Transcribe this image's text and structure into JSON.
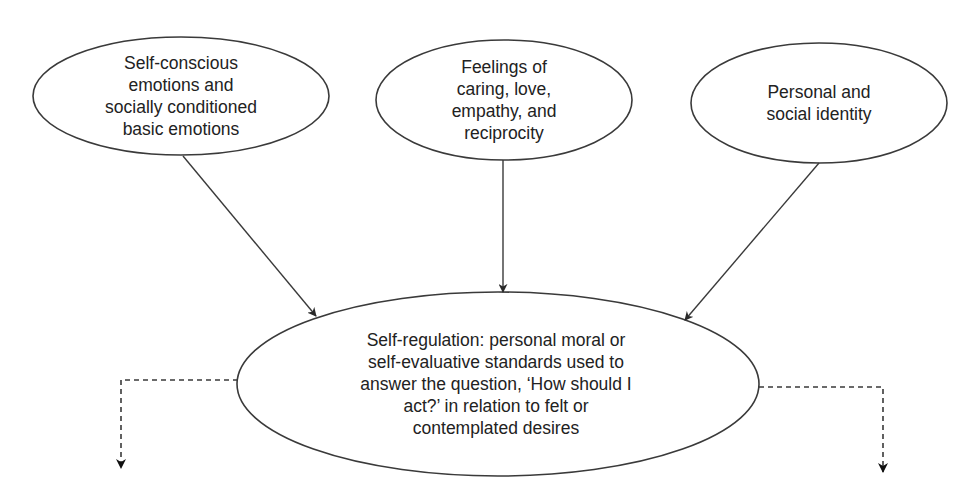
{
  "diagram": {
    "type": "flow",
    "colors": {
      "stroke": "#3a3a3a",
      "text": "#222222",
      "background": "#ffffff"
    },
    "nodes": [
      {
        "id": "self-conscious-emotions",
        "label": "Self-conscious\nemotions and\nsocially conditioned\nbasic emotions",
        "shape": "ellipse"
      },
      {
        "id": "feelings-of-caring",
        "label": "Feelings of\ncaring, love,\nempathy, and\nreciprocity",
        "shape": "ellipse"
      },
      {
        "id": "personal-social-identity",
        "label": "Personal and\nsocial identity",
        "shape": "ellipse"
      },
      {
        "id": "self-regulation",
        "label": "Self-regulation: personal moral or\nself-evaluative standards used to\nanswer the question, ‘How should I\nact?’ in relation to felt or\ncontemplated desires",
        "shape": "ellipse"
      }
    ],
    "edges": [
      {
        "from": "self-conscious-emotions",
        "to": "self-regulation",
        "style": "solid"
      },
      {
        "from": "feelings-of-caring",
        "to": "self-regulation",
        "style": "solid"
      },
      {
        "from": "personal-social-identity",
        "to": "self-regulation",
        "style": "solid"
      },
      {
        "from": "self-regulation",
        "to": "offscreen-left",
        "style": "dashed"
      },
      {
        "from": "self-regulation",
        "to": "offscreen-right",
        "style": "dashed"
      }
    ]
  }
}
